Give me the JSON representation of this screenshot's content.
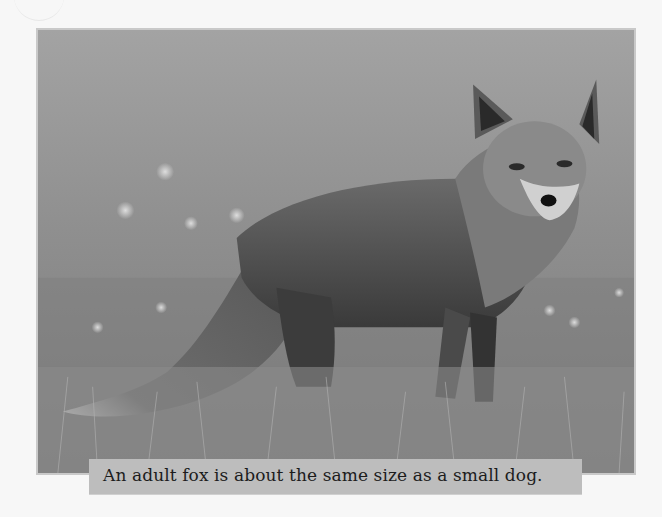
{
  "page": {
    "background": "#f7f7f7"
  },
  "photo": {
    "subject": "adult red fox standing in grassy meadow, head turned toward camera",
    "style": "grayscale",
    "background_color": "#9e9e9e",
    "border_color": "#c9c9c9"
  },
  "caption": {
    "text": "An adult fox is about the same size as a small dog.",
    "background_color": "#bdbdbd",
    "text_color": "#1c1c1c"
  }
}
